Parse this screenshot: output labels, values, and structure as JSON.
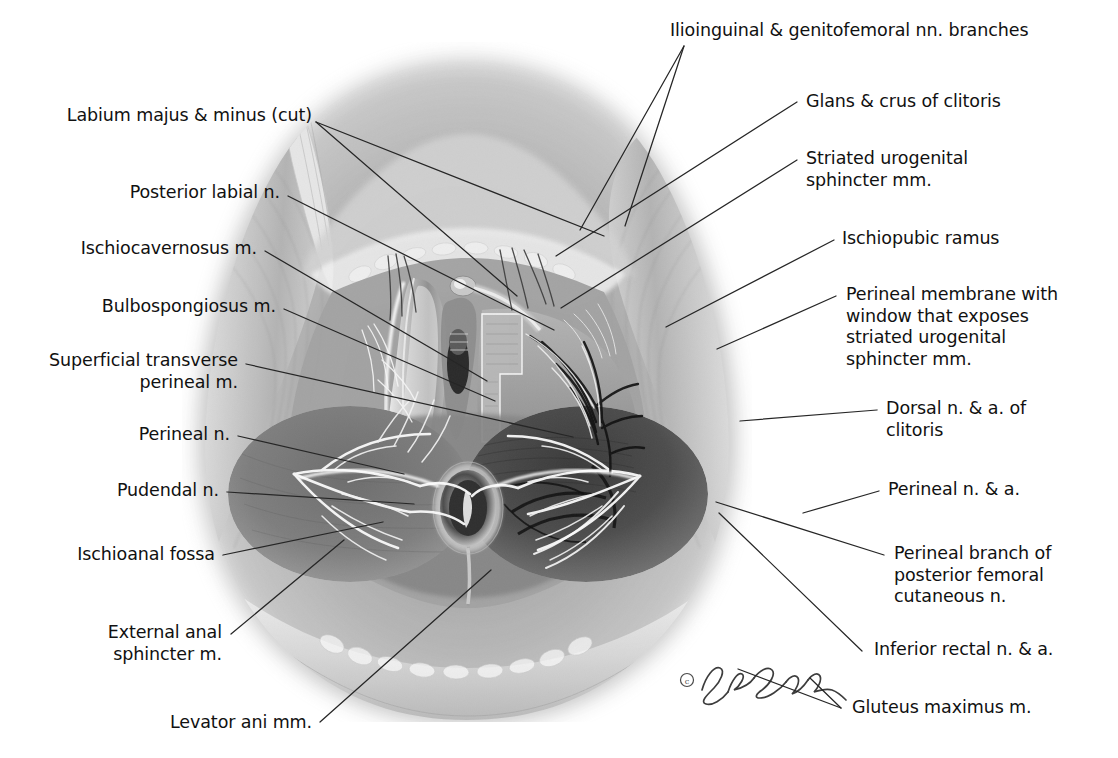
{
  "figure": {
    "copyright_mark": "©",
    "signature": "JE Calver",
    "background_color": "#ffffff",
    "ink_color": "#111111",
    "leader_color": "#262626"
  },
  "labels_left": [
    {
      "id": "labium-majus-minus",
      "text": "Labium majus & minus (cut)"
    },
    {
      "id": "posterior-labial-n",
      "text": "Posterior labial n."
    },
    {
      "id": "ischiocavernosus-m",
      "text": "Ischiocavernosus m."
    },
    {
      "id": "bulbospongiosus-m",
      "text": "Bulbospongiosus m."
    },
    {
      "id": "superficial-transverse-perineal-m",
      "text": "Superficial transverse\nperineal m."
    },
    {
      "id": "perineal-n",
      "text": "Perineal n."
    },
    {
      "id": "pudendal-n",
      "text": "Pudendal n."
    },
    {
      "id": "ischioanal-fossa",
      "text": "Ischioanal fossa"
    },
    {
      "id": "external-anal-sphincter-m",
      "text": "External anal\nsphincter m."
    },
    {
      "id": "levator-ani-mm",
      "text": "Levator ani mm."
    }
  ],
  "labels_right": [
    {
      "id": "ilioinguinal-genitofemoral-nn",
      "text": "Ilioinguinal & genitofemoral nn. branches"
    },
    {
      "id": "glans-crus-clitoris",
      "text": "Glans & crus of clitoris"
    },
    {
      "id": "striated-urogenital-sphincter-mm",
      "text": "Striated urogenital\nsphincter mm."
    },
    {
      "id": "ischiopubic-ramus",
      "text": "Ischiopubic ramus"
    },
    {
      "id": "perineal-membrane-window",
      "text": "Perineal membrane with\nwindow that exposes\nstriated urogenital\nsphincter mm."
    },
    {
      "id": "dorsal-n-a-clitoris",
      "text": "Dorsal n. & a. of\nclitoris"
    },
    {
      "id": "perineal-n-a",
      "text": "Perineal n. & a."
    },
    {
      "id": "perineal-branch-posterior-femoral-cutaneous-n",
      "text": "Perineal branch of\nposterior femoral\ncutaneous n."
    },
    {
      "id": "inferior-rectal-n-a",
      "text": "Inferior rectal n. & a."
    },
    {
      "id": "gluteus-maximus-m",
      "text": "Gluteus maximus m."
    }
  ]
}
